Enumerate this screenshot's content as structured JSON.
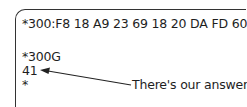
{
  "terminal": {
    "lines": [
      "*300:F8 18 A9 23 69 18 20 DA FD 60",
      "",
      "*300G",
      "41",
      "*"
    ]
  },
  "annotation": {
    "label": "There's our answer",
    "target_line": "41"
  },
  "colors": {
    "text": "#1e1e1e",
    "border": "#333333",
    "background": "#ffffff"
  }
}
